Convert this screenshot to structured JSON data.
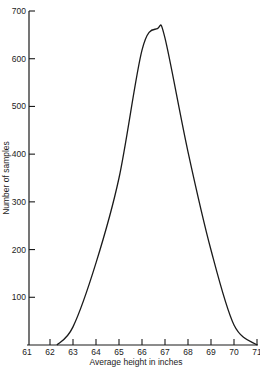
{
  "chart_data": {
    "type": "line",
    "title": "",
    "xlabel": "Average height in inches",
    "ylabel": "Number of samples",
    "xlim": [
      61,
      71
    ],
    "ylim": [
      0,
      700
    ],
    "grid": false,
    "legend": null,
    "x_ticks": [
      61,
      62,
      63,
      64,
      65,
      66,
      67,
      68,
      69,
      70,
      71
    ],
    "y_ticks": [
      100,
      200,
      300,
      400,
      500,
      600,
      700
    ],
    "series": [
      {
        "name": "Distribution of average heights",
        "x": [
          62.3,
          63,
          64,
          65,
          66,
          66.67,
          67,
          68,
          69,
          70,
          71
        ],
        "y": [
          0,
          38,
          172,
          350,
          618,
          663,
          643,
          405,
          199,
          42,
          0
        ]
      }
    ],
    "peak": {
      "x": 66.67,
      "y": 663
    },
    "line_color": "#1a1a1a"
  }
}
